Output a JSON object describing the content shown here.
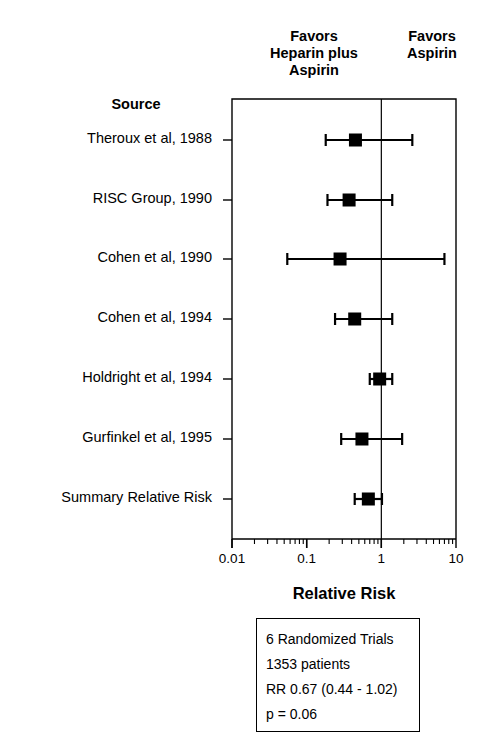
{
  "header": {
    "favors_left": "Favors\nHeparin plus\nAspirin",
    "favors_right": "Favors\nAspirin",
    "source_label": "Source"
  },
  "axis": {
    "title": "Relative Risk",
    "ticks": [
      "0.01",
      "0.1",
      "1",
      "10"
    ],
    "tick_values": [
      0.01,
      0.1,
      1,
      10
    ],
    "scale": "log",
    "null_line": 1
  },
  "summary_box": {
    "lines": [
      "6 Randomized Trials",
      "1353 patients",
      "RR 0.67 (0.44 - 1.02)",
      "p = 0.06"
    ]
  },
  "chart_data": {
    "type": "forest",
    "title": "",
    "xlabel": "Relative Risk",
    "ylabel": "Source",
    "xscale": "log",
    "xlim": [
      0.01,
      10
    ],
    "xticks": [
      0.01,
      0.1,
      1,
      10
    ],
    "xticklabels": [
      "0.01",
      "0.1",
      "1",
      "10"
    ],
    "reference_line": 1,
    "grid": false,
    "legend": "none",
    "annotations": [
      "Favors Heparin plus Aspirin",
      "Favors Aspirin",
      "6 Randomized Trials",
      "1353 patients",
      "RR 0.67 (0.44 - 1.02)",
      "p = 0.06"
    ],
    "categories": [
      "Theroux et al, 1988",
      "RISC Group, 1990",
      "Cohen et al, 1990",
      "Cohen et al, 1994",
      "Holdright et al, 1994",
      "Gurfinkel et al, 1995",
      "Summary Relative Risk"
    ],
    "points": [
      {
        "label": "Theroux et al, 1988",
        "rr": 0.45,
        "ci_low": 0.18,
        "ci_high": 2.6,
        "summary": false
      },
      {
        "label": "RISC Group, 1990",
        "rr": 0.37,
        "ci_low": 0.19,
        "ci_high": 1.4,
        "summary": false
      },
      {
        "label": "Cohen et al, 1990",
        "rr": 0.28,
        "ci_low": 0.055,
        "ci_high": 7.0,
        "summary": false
      },
      {
        "label": "Cohen et al, 1994",
        "rr": 0.44,
        "ci_low": 0.24,
        "ci_high": 1.4,
        "summary": false
      },
      {
        "label": "Holdright et al, 1994",
        "rr": 0.95,
        "ci_low": 0.7,
        "ci_high": 1.4,
        "summary": false
      },
      {
        "label": "Gurfinkel et al, 1995",
        "rr": 0.55,
        "ci_low": 0.29,
        "ci_high": 1.9,
        "summary": false
      },
      {
        "label": "Summary Relative Risk",
        "rr": 0.67,
        "ci_low": 0.44,
        "ci_high": 1.02,
        "summary": true
      }
    ]
  },
  "style": {
    "ink": "#000000",
    "background": "#ffffff"
  }
}
